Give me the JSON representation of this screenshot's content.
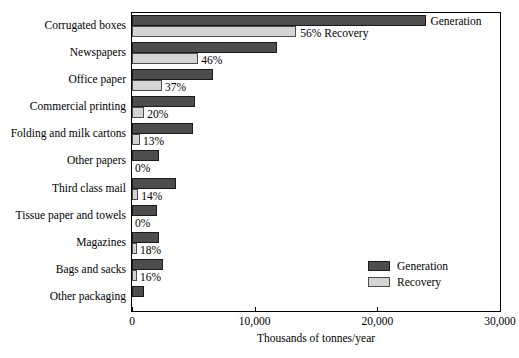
{
  "chart_data": {
    "type": "bar",
    "orientation": "horizontal",
    "title": "",
    "xlabel": "Thousands of tonnes/year",
    "ylabel": "",
    "xlim": [
      0,
      30000
    ],
    "xticks": [
      0,
      10000,
      20000,
      30000
    ],
    "xtick_labels": [
      "0",
      "10,000",
      "20,000",
      "30,000"
    ],
    "grid": false,
    "legend_position": "inside-bottom-right",
    "categories": [
      "Corrugated boxes",
      "Newspapers",
      "Office paper",
      "Commercial printing",
      "Folding and milk cartons",
      "Other papers",
      "Third class mail",
      "Tissue paper and towels",
      "Magazines",
      "Bags and sacks",
      "Other packaging"
    ],
    "series": [
      {
        "name": "Generation",
        "color": "#4d4d4d",
        "values": [
          24000,
          11800,
          6600,
          5100,
          5000,
          2200,
          3600,
          2000,
          2200,
          2500,
          1000
        ]
      },
      {
        "name": "Recovery",
        "color": "#d4d4d4",
        "values": [
          13400,
          5400,
          2450,
          1000,
          650,
          0,
          500,
          0,
          400,
          400,
          0
        ]
      }
    ],
    "recovery_percent_labels": [
      "56%",
      "46%",
      "37%",
      "20%",
      "13%",
      "0%",
      "14%",
      "0%",
      "18%",
      "16%",
      ""
    ],
    "inline_labels": {
      "generation": "Generation",
      "recovery": "56% Recovery"
    }
  },
  "legend": {
    "items": [
      {
        "label": "Generation",
        "color": "#4d4d4d"
      },
      {
        "label": "Recovery",
        "color": "#d4d4d4"
      }
    ]
  }
}
